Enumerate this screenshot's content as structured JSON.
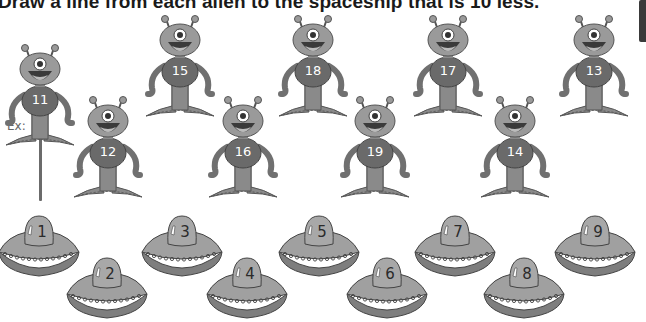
{
  "worksheet": {
    "instruction": "Draw a line from each alien to the spaceship that is 10 less.",
    "example_label": "Ex:"
  },
  "colors": {
    "alien_head": "#9a9a9a",
    "alien_body": "#6a6a6a",
    "alien_limbs": "#8a8a8a",
    "ship_dome": "#a8a8a8",
    "ship_top": "#a0a0a0",
    "ship_bottom": "#7e7e7e",
    "example_line": "#6b6b6b"
  },
  "aliens": [
    {
      "number": "11",
      "x": 40,
      "y": 101,
      "row": "top",
      "example": true
    },
    {
      "number": "12",
      "x": 108,
      "y": 153,
      "row": "bottom"
    },
    {
      "number": "15",
      "x": 180,
      "y": 72,
      "row": "top"
    },
    {
      "number": "16",
      "x": 243,
      "y": 153,
      "row": "bottom"
    },
    {
      "number": "18",
      "x": 313,
      "y": 72,
      "row": "top"
    },
    {
      "number": "19",
      "x": 375,
      "y": 153,
      "row": "bottom"
    },
    {
      "number": "17",
      "x": 448,
      "y": 72,
      "row": "top"
    },
    {
      "number": "14",
      "x": 515,
      "y": 153,
      "row": "bottom"
    },
    {
      "number": "13",
      "x": 594,
      "y": 72,
      "row": "top"
    }
  ],
  "spaceships": [
    {
      "number": "1",
      "x": 42,
      "y": 232
    },
    {
      "number": "2",
      "x": 110,
      "y": 274
    },
    {
      "number": "3",
      "x": 185,
      "y": 232
    },
    {
      "number": "4",
      "x": 250,
      "y": 274
    },
    {
      "number": "5",
      "x": 322,
      "y": 232
    },
    {
      "number": "6",
      "x": 390,
      "y": 274
    },
    {
      "number": "7",
      "x": 458,
      "y": 232
    },
    {
      "number": "8",
      "x": 527,
      "y": 274
    },
    {
      "number": "9",
      "x": 598,
      "y": 232
    }
  ]
}
